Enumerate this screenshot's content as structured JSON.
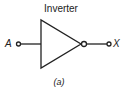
{
  "diagram": {
    "title": "Inverter",
    "input_label": "A",
    "output_label": "X",
    "caption": "(a)",
    "gate": {
      "type": "NOT",
      "symbol": "triangle-with-bubble"
    },
    "colors": {
      "stroke": "#222222",
      "background": "#ffffff"
    }
  }
}
